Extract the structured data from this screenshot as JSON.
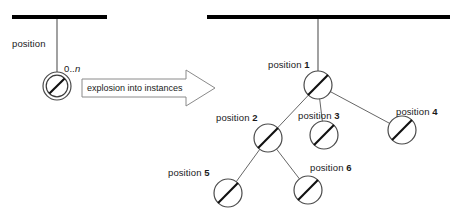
{
  "diagram": {
    "title": "explosion into instances",
    "colors": {
      "bar": "#000000",
      "line": "#555555",
      "node_stroke": "#4a4a4a",
      "slash": "#000000",
      "arrow_stroke": "#8a8a8a",
      "arrow_fill": "#ffffff",
      "text": "#1a1a1a",
      "background": "#ffffff"
    },
    "left_side": {
      "class_bar": {
        "x1": 12,
        "x2": 107,
        "y": 17
      },
      "association_label": "position",
      "multiplicity": {
        "prefix": "0..",
        "variable": "n"
      },
      "node": {
        "cx": 57,
        "cy": 86,
        "outer_r": 14,
        "inner_r": 11
      },
      "connector": {
        "x": 57,
        "y1": 19,
        "y2": 72
      }
    },
    "transform_arrow": {
      "label": "explosion into instances",
      "body": {
        "x": 82,
        "y": 79,
        "width": 104,
        "height": 18
      },
      "head": {
        "tip_x": 215,
        "top_y": 70,
        "bottom_y": 106,
        "base_x": 186
      }
    },
    "right_side": {
      "class_bar": {
        "x1": 207,
        "x2": 450,
        "y": 17
      },
      "root_connector": {
        "x": 318,
        "y1": 19,
        "y2": 71
      },
      "node_radius": 14,
      "nodes": [
        {
          "id": "n1",
          "label_prefix": "position",
          "number": "1",
          "cx": 318,
          "cy": 85,
          "label_x": 268,
          "label_y": 65,
          "label_align": "left"
        },
        {
          "id": "n2",
          "label_prefix": "position",
          "number": "2",
          "cx": 268,
          "cy": 138,
          "label_x": 216,
          "label_y": 118,
          "label_align": "left"
        },
        {
          "id": "n3",
          "label_prefix": "position",
          "number": "3",
          "cx": 324,
          "cy": 135,
          "label_x": 298,
          "label_y": 115,
          "label_align": "left"
        },
        {
          "id": "n4",
          "label_prefix": "position",
          "number": "4",
          "cx": 402,
          "cy": 130,
          "label_x": 396,
          "label_y": 110,
          "label_align": "left"
        },
        {
          "id": "n5",
          "label_prefix": "position",
          "number": "5",
          "cx": 228,
          "cy": 193,
          "label_x": 168,
          "label_y": 173,
          "label_align": "left"
        },
        {
          "id": "n6",
          "label_prefix": "position",
          "number": "6",
          "cx": 308,
          "cy": 190,
          "label_x": 310,
          "label_y": 167,
          "label_align": "left"
        }
      ],
      "edges": [
        {
          "from": "n1",
          "to": "n2"
        },
        {
          "from": "n1",
          "to": "n3"
        },
        {
          "from": "n1",
          "to": "n4"
        },
        {
          "from": "n2",
          "to": "n5"
        },
        {
          "from": "n2",
          "to": "n6"
        }
      ]
    }
  }
}
